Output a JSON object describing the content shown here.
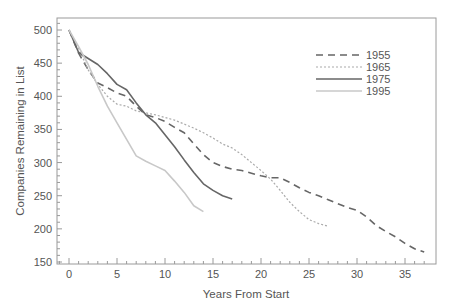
{
  "chart_data": {
    "type": "line",
    "title": "",
    "xlabel": "Years From Start",
    "ylabel": "Companies Remaining in List",
    "xlim": [
      -1.3,
      38
    ],
    "ylim": [
      145,
      518
    ],
    "xticks": [
      0,
      5,
      10,
      15,
      20,
      25,
      30,
      35
    ],
    "yticks": [
      150,
      200,
      250,
      300,
      350,
      400,
      450,
      500
    ],
    "grid": false,
    "legend_position": "upper right",
    "series": [
      {
        "name": "1955",
        "style": "dashed",
        "color": "#666666",
        "x": [
          0,
          1,
          2,
          3,
          4,
          5,
          6,
          7,
          8,
          9,
          10,
          11,
          12,
          13,
          14,
          15,
          16,
          17,
          18,
          19,
          20,
          21,
          22,
          23,
          24,
          25,
          26,
          27,
          28,
          29,
          30,
          31,
          32,
          33,
          34,
          35,
          36,
          37
        ],
        "values": [
          500,
          465,
          440,
          420,
          413,
          405,
          400,
          385,
          372,
          368,
          362,
          353,
          345,
          328,
          312,
          300,
          294,
          290,
          288,
          284,
          280,
          277,
          277,
          270,
          262,
          255,
          250,
          244,
          238,
          232,
          228,
          218,
          205,
          196,
          188,
          178,
          170,
          165
        ]
      },
      {
        "name": "1965",
        "style": "dotted",
        "color": "#aaaaaa",
        "x": [
          0,
          1,
          2,
          3,
          4,
          5,
          6,
          7,
          8,
          9,
          10,
          11,
          12,
          13,
          14,
          15,
          16,
          17,
          18,
          19,
          20,
          21,
          22,
          23,
          24,
          25,
          26,
          27
        ],
        "values": [
          500,
          472,
          440,
          418,
          400,
          388,
          385,
          378,
          375,
          372,
          368,
          364,
          358,
          352,
          345,
          337,
          328,
          322,
          312,
          300,
          288,
          275,
          258,
          240,
          226,
          214,
          208,
          204
        ]
      },
      {
        "name": "1975",
        "style": "solid",
        "color": "#666666",
        "x": [
          0,
          1,
          2,
          3,
          4,
          5,
          6,
          7,
          8,
          9,
          10,
          11,
          12,
          13,
          14,
          15,
          16,
          17
        ],
        "values": [
          500,
          466,
          457,
          448,
          434,
          418,
          410,
          390,
          372,
          360,
          342,
          324,
          304,
          285,
          268,
          258,
          250,
          245
        ]
      },
      {
        "name": "1995",
        "style": "solid",
        "color": "#c8c8c8",
        "x": [
          0,
          1,
          2,
          3,
          4,
          5,
          6,
          7,
          8,
          9,
          10,
          11,
          12,
          13,
          14
        ],
        "values": [
          500,
          475,
          448,
          415,
          385,
          360,
          335,
          310,
          302,
          295,
          288,
          272,
          255,
          235,
          226
        ]
      }
    ]
  }
}
